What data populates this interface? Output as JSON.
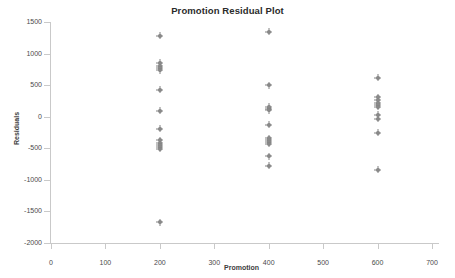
{
  "chart_data": {
    "type": "scatter",
    "title": "Promotion Residual Plot",
    "xlabel": "Promotion",
    "ylabel": "Residuals",
    "xlim": [
      0,
      700
    ],
    "ylim": [
      -2000,
      1500
    ],
    "xticks": [
      0,
      100,
      200,
      300,
      400,
      500,
      600,
      700
    ],
    "yticks": [
      1500,
      1000,
      500,
      0,
      -500,
      -1000,
      -1500,
      -2000
    ],
    "xtick_labels": [
      "0",
      "100",
      "200",
      "300",
      "400",
      "500",
      "600",
      "700"
    ],
    "ytick_labels": [
      "1500",
      "1000",
      "500",
      "0",
      "-500",
      "-1000",
      "-1500",
      "-2000"
    ],
    "grid": false,
    "legend": false,
    "marker_color": "#7b7b7b",
    "marker_style": "asterisk-dot",
    "series": [
      {
        "name": "Residuals",
        "points": [
          [
            200,
            1280
          ],
          [
            200,
            855
          ],
          [
            200,
            800
          ],
          [
            200,
            770
          ],
          [
            200,
            735
          ],
          [
            200,
            430
          ],
          [
            200,
            95
          ],
          [
            200,
            -190
          ],
          [
            200,
            -370
          ],
          [
            200,
            -420
          ],
          [
            200,
            -450
          ],
          [
            200,
            -480
          ],
          [
            200,
            -510
          ],
          [
            200,
            -1670
          ],
          [
            400,
            1345
          ],
          [
            400,
            495
          ],
          [
            400,
            155
          ],
          [
            400,
            130
          ],
          [
            400,
            100
          ],
          [
            400,
            -125
          ],
          [
            400,
            -340
          ],
          [
            400,
            -375
          ],
          [
            400,
            -400
          ],
          [
            400,
            -430
          ],
          [
            400,
            -625
          ],
          [
            400,
            -780
          ],
          [
            600,
            620
          ],
          [
            600,
            310
          ],
          [
            600,
            265
          ],
          [
            600,
            225
          ],
          [
            600,
            180
          ],
          [
            600,
            155
          ],
          [
            600,
            30
          ],
          [
            600,
            -30
          ],
          [
            600,
            -255
          ],
          [
            600,
            -840
          ]
        ]
      }
    ]
  }
}
